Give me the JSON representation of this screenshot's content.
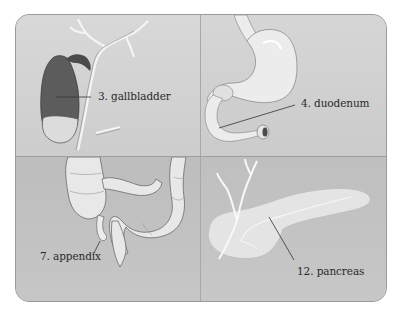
{
  "figure": {
    "panels": [
      {
        "id": "gallbladder",
        "label": "3. gallbladder"
      },
      {
        "id": "duodenum",
        "label": "4. duodenum"
      },
      {
        "id": "appendix",
        "label": "7. appendix"
      },
      {
        "id": "pancreas",
        "label": "12. pancreas"
      }
    ],
    "colors": {
      "panel_background": "#d3d3d3",
      "lower_panel_background": "#c2c2c2",
      "organ_fill": "#ececec",
      "gallbladder_dark": "#5a5a5a",
      "leader_line": "#333333"
    }
  }
}
